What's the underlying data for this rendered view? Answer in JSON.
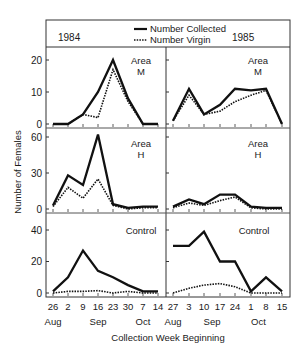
{
  "chart_data": {
    "type": "line",
    "title": "",
    "xlabel": "Collection Week Beginning",
    "ylabel": "Number of Females",
    "legend": {
      "position": "top-center",
      "entries": [
        {
          "name": "Number Collected",
          "style": "solid"
        },
        {
          "name": "Number Virgin",
          "style": "dotted"
        }
      ]
    },
    "years": [
      "1984",
      "1985"
    ],
    "x_1984": {
      "tick_labels": [
        "26",
        "2",
        "9",
        "16",
        "23",
        "30",
        "7",
        "14"
      ],
      "month_labels": [
        {
          "label": "Aug",
          "at": 0
        },
        {
          "label": "Sep",
          "at": 3
        },
        {
          "label": "Oct",
          "at": 6
        }
      ]
    },
    "x_1985": {
      "tick_labels": [
        "27",
        "3",
        "10",
        "17",
        "24",
        "1",
        "8",
        "15"
      ],
      "month_labels": [
        {
          "label": "Aug",
          "at": 0
        },
        {
          "label": "Sep",
          "at": 2.5
        },
        {
          "label": "Oct",
          "at": 5.5
        }
      ]
    },
    "panels": [
      {
        "row": "Area M",
        "year": "1984",
        "ylim": [
          0,
          20
        ],
        "yticks": [
          0,
          10,
          20
        ],
        "series": [
          {
            "name": "Number Collected",
            "values": [
              0,
              0,
              3,
              10,
              20,
              8,
              0,
              0
            ]
          },
          {
            "name": "Number Virgin",
            "values": [
              0,
              0,
              3,
              2,
              17,
              7,
              0,
              0
            ]
          }
        ]
      },
      {
        "row": "Area M",
        "year": "1985",
        "ylim": [
          0,
          20
        ],
        "yticks": [
          0,
          10,
          20
        ],
        "series": [
          {
            "name": "Number Collected",
            "values": [
              1,
              11,
              3,
              6,
              11,
              10.5,
              11,
              0
            ]
          },
          {
            "name": "Number Virgin",
            "values": [
              1,
              9,
              3,
              4,
              7,
              9,
              10.5,
              0
            ]
          }
        ]
      },
      {
        "row": "Area H",
        "year": "1984",
        "ylim": [
          0,
          60
        ],
        "yticks": [
          0,
          30,
          60
        ],
        "series": [
          {
            "name": "Number Collected",
            "values": [
              3,
              28,
              20,
              62,
              4,
              1,
              2,
              2
            ]
          },
          {
            "name": "Number Virgin",
            "values": [
              2,
              18,
              9,
              25,
              3,
              0,
              1,
              1
            ]
          }
        ]
      },
      {
        "row": "Area H",
        "year": "1985",
        "ylim": [
          0,
          60
        ],
        "yticks": [
          0,
          30,
          60
        ],
        "series": [
          {
            "name": "Number Collected",
            "values": [
              2,
              8,
              4,
              12,
              12,
              2,
              1,
              1
            ]
          },
          {
            "name": "Number Virgin",
            "values": [
              1,
              5,
              3,
              7,
              10,
              1,
              0,
              0
            ]
          }
        ]
      },
      {
        "row": "Control",
        "year": "1984",
        "ylim": [
          0,
          40
        ],
        "yticks": [
          0,
          20,
          40
        ],
        "series": [
          {
            "name": "Number Collected",
            "values": [
              1,
              10,
              27,
              14,
              10,
              5,
              1,
              1
            ]
          },
          {
            "name": "Number Virgin",
            "values": [
              0,
              1,
              1,
              1.5,
              0,
              1,
              0,
              0
            ]
          }
        ]
      },
      {
        "row": "Control",
        "year": "1985",
        "ylim": [
          0,
          40
        ],
        "yticks": [
          0,
          20,
          40
        ],
        "series": [
          {
            "name": "Number Collected",
            "values": [
              30,
              30,
              39,
              20,
              20,
              1,
              10,
              1
            ]
          },
          {
            "name": "Number Virgin",
            "values": [
              0,
              3,
              5,
              6,
              4,
              0,
              0,
              0
            ]
          }
        ]
      }
    ],
    "grid": false
  },
  "labels": {
    "year_left": "1984",
    "year_right": "1985",
    "legend_collected": "Number Collected",
    "legend_virgin": "Number Virgin",
    "y_axis_title": "Number of Females",
    "x_axis_title": "Collection Week Beginning",
    "area_word": "Area",
    "row_m_letter": "M",
    "row_h_letter": "H",
    "control": "Control"
  }
}
